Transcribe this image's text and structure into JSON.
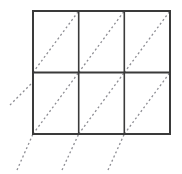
{
  "figure": {
    "canvas": {
      "width": 182,
      "height": 174,
      "background": "#ffffff"
    },
    "grid": {
      "columns": 3,
      "rows": 2,
      "left": 33,
      "top": 11,
      "right": 170,
      "bottom": 134,
      "cell_width": 45.67,
      "cell_height": 61.5,
      "vertical_divider_x": [
        78.7,
        124.3
      ],
      "horizontal_divider_y": [
        72.5
      ],
      "line_color": "#3a3a3a",
      "outer_stroke_width": 2,
      "inner_stroke_width": 1.6,
      "fill": "#ffffff"
    },
    "diagonals": {
      "style": "dashed",
      "color": "#8d8d93",
      "stroke_width": 1.3,
      "dash_pattern": "2 2.6",
      "slope_label": "45 degrees, lower-left to upper-right",
      "count": 9,
      "segments": [
        {
          "id": "d1",
          "x1": 10,
          "y1": 105,
          "x2": 33,
          "y2": 82
        },
        {
          "id": "d2",
          "x1": 33,
          "y1": 72.5,
          "x2": 78.7,
          "y2": 11
        },
        {
          "id": "d3",
          "x1": 78.7,
          "y1": 72.5,
          "x2": 124.3,
          "y2": 11
        },
        {
          "id": "d4",
          "x1": 124.3,
          "y1": 72.5,
          "x2": 170,
          "y2": 11
        },
        {
          "id": "d5",
          "x1": 33,
          "y1": 134,
          "x2": 78.7,
          "y2": 72.5
        },
        {
          "id": "d6",
          "x1": 78.7,
          "y1": 134,
          "x2": 124.3,
          "y2": 72.5
        },
        {
          "id": "d7",
          "x1": 124.3,
          "y1": 134,
          "x2": 170,
          "y2": 72.5
        },
        {
          "id": "d8",
          "x1": 17,
          "y1": 170,
          "x2": 33,
          "y2": 134
        },
        {
          "id": "d9",
          "x1": 62,
          "y1": 170,
          "x2": 78.7,
          "y2": 134
        },
        {
          "id": "d10",
          "x1": 108,
          "y1": 170,
          "x2": 124.3,
          "y2": 134
        }
      ]
    },
    "grid_lines": {
      "horizontal": [
        {
          "id": "h-top",
          "x1": 33,
          "y1": 11,
          "x2": 170,
          "y2": 11,
          "weight": "outer"
        },
        {
          "id": "h-middle",
          "x1": 33,
          "y1": 72.5,
          "x2": 170,
          "y2": 72.5,
          "weight": "outer"
        },
        {
          "id": "h-bottom",
          "x1": 33,
          "y1": 134,
          "x2": 170,
          "y2": 134,
          "weight": "outer"
        }
      ],
      "vertical": [
        {
          "id": "v-left",
          "x1": 33,
          "y1": 11,
          "x2": 33,
          "y2": 134,
          "weight": "outer"
        },
        {
          "id": "v-mid-1",
          "x1": 78.7,
          "y1": 11,
          "x2": 78.7,
          "y2": 134,
          "weight": "inner"
        },
        {
          "id": "v-mid-2",
          "x1": 124.3,
          "y1": 11,
          "x2": 124.3,
          "y2": 134,
          "weight": "inner"
        },
        {
          "id": "v-right",
          "x1": 170,
          "y1": 11,
          "x2": 170,
          "y2": 134,
          "weight": "outer"
        }
      ]
    },
    "cells": [
      {
        "id": "cell-r1c1",
        "row": 1,
        "col": 1
      },
      {
        "id": "cell-r1c2",
        "row": 1,
        "col": 2
      },
      {
        "id": "cell-r1c3",
        "row": 1,
        "col": 3
      },
      {
        "id": "cell-r2c1",
        "row": 2,
        "col": 1
      },
      {
        "id": "cell-r2c2",
        "row": 2,
        "col": 2
      },
      {
        "id": "cell-r2c3",
        "row": 2,
        "col": 3
      }
    ]
  }
}
